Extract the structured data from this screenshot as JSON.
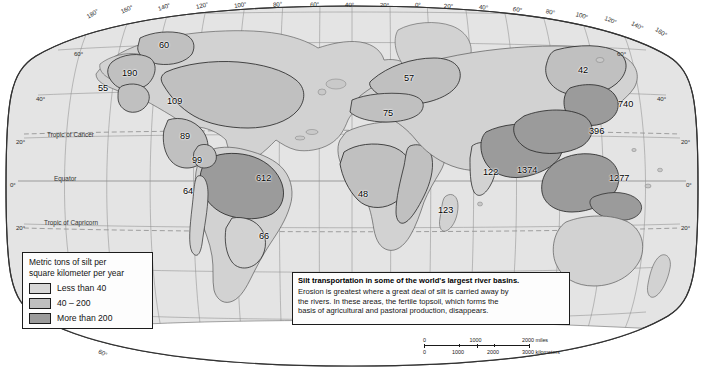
{
  "map": {
    "projection_name": "robinson-oval",
    "colors": {
      "ocean": "#e3e3e3",
      "land_light": "#d2d2d2",
      "land_medium": "#bdbdbd",
      "land_dark": "#9b9b9b",
      "graticule": "#8c8c8c",
      "coast": "#4a4a4a",
      "outline": "#333333",
      "box_fill": "#fdfdfd",
      "box_border": "#1c1c1c",
      "text": "#111111"
    },
    "longitude_labels_top": [
      {
        "text": "180°",
        "x": 87,
        "y": 13,
        "rot": -31
      },
      {
        "text": "160°",
        "x": 121,
        "y": 8,
        "rot": -24
      },
      {
        "text": "140°",
        "x": 158,
        "y": 5,
        "rot": -18
      },
      {
        "text": "120°",
        "x": 196,
        "y": 3,
        "rot": -13
      },
      {
        "text": "100°",
        "x": 234,
        "y": 2,
        "rot": -9
      },
      {
        "text": "80°",
        "x": 273,
        "y": 1,
        "rot": -6
      },
      {
        "text": "60°",
        "x": 310,
        "y": 1,
        "rot": -3
      },
      {
        "text": "40°",
        "x": 345,
        "y": 1,
        "rot": -1
      },
      {
        "text": "20°",
        "x": 380,
        "y": 1,
        "rot": 0
      },
      {
        "text": "0°",
        "x": 415,
        "y": 1,
        "rot": 1
      },
      {
        "text": "20°",
        "x": 444,
        "y": 2,
        "rot": 3
      },
      {
        "text": "40°",
        "x": 479,
        "y": 3,
        "rot": 6
      },
      {
        "text": "60°",
        "x": 513,
        "y": 5,
        "rot": 9
      },
      {
        "text": "80°",
        "x": 546,
        "y": 7,
        "rot": 13
      },
      {
        "text": "100°",
        "x": 576,
        "y": 10,
        "rot": 17
      },
      {
        "text": "120°",
        "x": 605,
        "y": 14,
        "rot": 22
      },
      {
        "text": "140°",
        "x": 632,
        "y": 19,
        "rot": 27
      },
      {
        "text": "160°",
        "x": 656,
        "y": 25,
        "rot": 32
      }
    ],
    "longitude_labels_bottom": [
      {
        "text": "60°",
        "x": 99,
        "y": 347,
        "rot": 30
      }
    ],
    "latitude_labels_left": [
      {
        "text": "60°",
        "x": 74,
        "y": 50
      },
      {
        "text": "40°",
        "x": 36,
        "y": 95
      },
      {
        "text": "20°",
        "x": 16,
        "y": 138
      },
      {
        "text": "0°",
        "x": 10,
        "y": 181
      },
      {
        "text": "20°",
        "x": 16,
        "y": 224
      }
    ],
    "latitude_labels_right": [
      {
        "text": "60°",
        "x": 617,
        "y": 50
      },
      {
        "text": "40°",
        "x": 657,
        "y": 95
      },
      {
        "text": "20°",
        "x": 681,
        "y": 138
      },
      {
        "text": "0°",
        "x": 686,
        "y": 181
      },
      {
        "text": "20°",
        "x": 681,
        "y": 224
      }
    ],
    "named_parallels": [
      {
        "text": "Tropic of Cancer",
        "x": 47,
        "y": 131
      },
      {
        "text": "Equator",
        "x": 54,
        "y": 175
      },
      {
        "text": "Tropic of Capricorn",
        "x": 44,
        "y": 219
      }
    ],
    "basin_values": [
      {
        "value": "60",
        "x": 159,
        "y": 40,
        "basin": "mackenzie"
      },
      {
        "value": "190",
        "x": 122,
        "y": 68,
        "basin": "yukon"
      },
      {
        "value": "55",
        "x": 98,
        "y": 83,
        "basin": "fraser"
      },
      {
        "value": "109",
        "x": 167,
        "y": 96,
        "basin": "mississippi"
      },
      {
        "value": "89",
        "x": 180,
        "y": 131,
        "basin": "rio-grande"
      },
      {
        "value": "99",
        "x": 192,
        "y": 155,
        "basin": "magdalena"
      },
      {
        "value": "64",
        "x": 183,
        "y": 186,
        "basin": "pacific-south-america"
      },
      {
        "value": "612",
        "x": 256,
        "y": 173,
        "basin": "amazon"
      },
      {
        "value": "66",
        "x": 259,
        "y": 231,
        "basin": "parana"
      },
      {
        "value": "57",
        "x": 404,
        "y": 73,
        "basin": "volga-danube"
      },
      {
        "value": "75",
        "x": 383,
        "y": 108,
        "basin": "mediterranean-rivers"
      },
      {
        "value": "48",
        "x": 358,
        "y": 189,
        "basin": "congo-niger"
      },
      {
        "value": "123",
        "x": 438,
        "y": 205,
        "basin": "zambezi"
      },
      {
        "value": "122",
        "x": 483,
        "y": 167,
        "basin": "indus"
      },
      {
        "value": "1374",
        "x": 517,
        "y": 165,
        "basin": "ganges-brahmaputra"
      },
      {
        "value": "42",
        "x": 578,
        "y": 65,
        "basin": "lena-amur"
      },
      {
        "value": "740",
        "x": 618,
        "y": 99,
        "basin": "huang-he"
      },
      {
        "value": "396",
        "x": 589,
        "y": 126,
        "basin": "yangtze"
      },
      {
        "value": "1277",
        "x": 609,
        "y": 173,
        "basin": "indonesia-philippines"
      }
    ]
  },
  "legend": {
    "title_line1": "Metric tons of silt per",
    "title_line2": "square kilometer per year",
    "classes": [
      {
        "label": "Less than 40",
        "color": "#d7d7d7"
      },
      {
        "label": "40 – 200",
        "color": "#bfbfbf"
      },
      {
        "label": "More than 200",
        "color": "#9b9b9b"
      }
    ]
  },
  "caption": {
    "headline": "Silt transportation in some of the world's largest river basins.",
    "body_line1": "Erosion is greatest where a great deal of silt is carried away by",
    "body_line2": "the rivers.  In these areas, the fertile topsoil, which forms the",
    "body_line3": "basis of agricultural and pastoral production, disappears."
  },
  "scalebar": {
    "miles": {
      "unit_label": "miles",
      "ticks": [
        "0",
        "1000",
        "2000"
      ]
    },
    "kilometers": {
      "unit_label": "kilometers",
      "ticks": [
        "0",
        "1000",
        "2000",
        "3000"
      ]
    }
  }
}
